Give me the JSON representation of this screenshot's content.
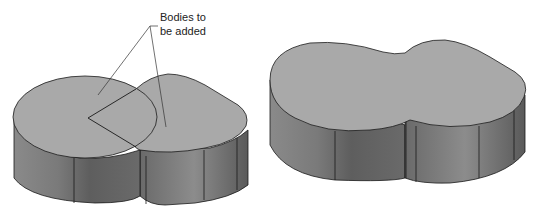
{
  "callout": {
    "line1": "Bodies to",
    "line2": "be added"
  },
  "figures": [
    {
      "name": "separate-bodies",
      "description": "Cylinder and rounded block overlapping before boolean add"
    },
    {
      "name": "combined-body",
      "description": "Resulting single merged body"
    }
  ],
  "colors": {
    "top_face": "#a9a9a9",
    "side_light": "#9a9a9a",
    "side_dark": "#6e6e6e",
    "edge": "#1a1a1a"
  }
}
